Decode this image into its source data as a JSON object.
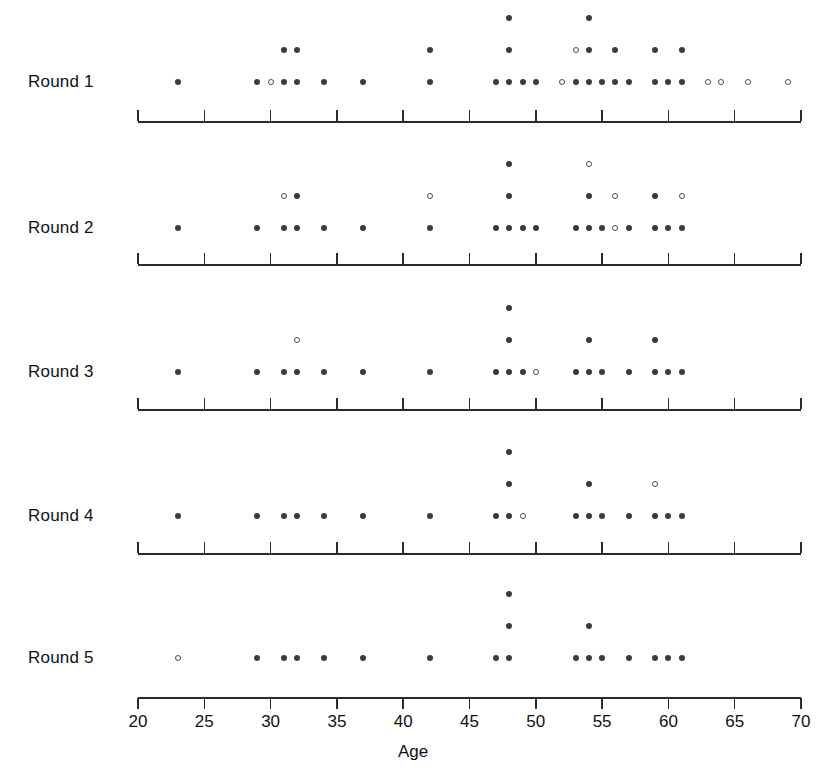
{
  "chart_data": {
    "type": "scatter",
    "title": "",
    "xlabel": "Age",
    "ylabel": "",
    "xlim": [
      20,
      70
    ],
    "xticks": [
      20,
      25,
      30,
      35,
      40,
      45,
      50,
      55,
      60,
      65,
      70
    ],
    "xtick_labels": [
      "20",
      "25",
      "30",
      "35",
      "40",
      "45",
      "50",
      "55",
      "60",
      "65",
      "70"
    ],
    "grid": false,
    "legend": "none",
    "marker_types": [
      "filled",
      "open"
    ],
    "colors": {
      "filled": "#3a3a42",
      "open": "#ffffff",
      "outline": "#4a4a52",
      "axis": "#2b2b2b"
    },
    "rows": [
      {
        "label": "Round 1",
        "points": [
          {
            "age": 23,
            "stack": 1,
            "marker": "filled"
          },
          {
            "age": 29,
            "stack": 1,
            "marker": "filled"
          },
          {
            "age": 30,
            "stack": 1,
            "marker": "open"
          },
          {
            "age": 31,
            "stack": 1,
            "marker": "filled"
          },
          {
            "age": 31,
            "stack": 2,
            "marker": "filled"
          },
          {
            "age": 32,
            "stack": 1,
            "marker": "filled"
          },
          {
            "age": 32,
            "stack": 2,
            "marker": "filled"
          },
          {
            "age": 34,
            "stack": 1,
            "marker": "filled"
          },
          {
            "age": 37,
            "stack": 1,
            "marker": "filled"
          },
          {
            "age": 42,
            "stack": 1,
            "marker": "filled"
          },
          {
            "age": 42,
            "stack": 2,
            "marker": "filled"
          },
          {
            "age": 47,
            "stack": 1,
            "marker": "filled"
          },
          {
            "age": 48,
            "stack": 1,
            "marker": "filled"
          },
          {
            "age": 48,
            "stack": 2,
            "marker": "filled"
          },
          {
            "age": 48,
            "stack": 3,
            "marker": "filled"
          },
          {
            "age": 49,
            "stack": 1,
            "marker": "filled"
          },
          {
            "age": 50,
            "stack": 1,
            "marker": "filled"
          },
          {
            "age": 52,
            "stack": 1,
            "marker": "open"
          },
          {
            "age": 53,
            "stack": 1,
            "marker": "filled"
          },
          {
            "age": 53,
            "stack": 2,
            "marker": "open"
          },
          {
            "age": 54,
            "stack": 1,
            "marker": "filled"
          },
          {
            "age": 54,
            "stack": 2,
            "marker": "filled"
          },
          {
            "age": 54,
            "stack": 3,
            "marker": "filled"
          },
          {
            "age": 55,
            "stack": 1,
            "marker": "filled"
          },
          {
            "age": 56,
            "stack": 1,
            "marker": "filled"
          },
          {
            "age": 56,
            "stack": 2,
            "marker": "filled"
          },
          {
            "age": 57,
            "stack": 1,
            "marker": "filled"
          },
          {
            "age": 59,
            "stack": 1,
            "marker": "filled"
          },
          {
            "age": 59,
            "stack": 2,
            "marker": "filled"
          },
          {
            "age": 60,
            "stack": 1,
            "marker": "filled"
          },
          {
            "age": 61,
            "stack": 1,
            "marker": "filled"
          },
          {
            "age": 61,
            "stack": 2,
            "marker": "filled"
          },
          {
            "age": 63,
            "stack": 1,
            "marker": "open"
          },
          {
            "age": 64,
            "stack": 1,
            "marker": "open"
          },
          {
            "age": 66,
            "stack": 1,
            "marker": "open"
          },
          {
            "age": 69,
            "stack": 1,
            "marker": "open"
          }
        ]
      },
      {
        "label": "Round 2",
        "points": [
          {
            "age": 23,
            "stack": 1,
            "marker": "filled"
          },
          {
            "age": 29,
            "stack": 1,
            "marker": "filled"
          },
          {
            "age": 31,
            "stack": 1,
            "marker": "filled"
          },
          {
            "age": 31,
            "stack": 2,
            "marker": "open"
          },
          {
            "age": 32,
            "stack": 1,
            "marker": "filled"
          },
          {
            "age": 32,
            "stack": 2,
            "marker": "filled"
          },
          {
            "age": 34,
            "stack": 1,
            "marker": "filled"
          },
          {
            "age": 37,
            "stack": 1,
            "marker": "filled"
          },
          {
            "age": 42,
            "stack": 1,
            "marker": "filled"
          },
          {
            "age": 42,
            "stack": 2,
            "marker": "open"
          },
          {
            "age": 47,
            "stack": 1,
            "marker": "filled"
          },
          {
            "age": 48,
            "stack": 1,
            "marker": "filled"
          },
          {
            "age": 48,
            "stack": 2,
            "marker": "filled"
          },
          {
            "age": 48,
            "stack": 3,
            "marker": "filled"
          },
          {
            "age": 49,
            "stack": 1,
            "marker": "filled"
          },
          {
            "age": 50,
            "stack": 1,
            "marker": "filled"
          },
          {
            "age": 53,
            "stack": 1,
            "marker": "filled"
          },
          {
            "age": 54,
            "stack": 1,
            "marker": "filled"
          },
          {
            "age": 54,
            "stack": 2,
            "marker": "filled"
          },
          {
            "age": 54,
            "stack": 3,
            "marker": "open"
          },
          {
            "age": 55,
            "stack": 1,
            "marker": "filled"
          },
          {
            "age": 56,
            "stack": 1,
            "marker": "open"
          },
          {
            "age": 56,
            "stack": 2,
            "marker": "open"
          },
          {
            "age": 57,
            "stack": 1,
            "marker": "filled"
          },
          {
            "age": 59,
            "stack": 1,
            "marker": "filled"
          },
          {
            "age": 59,
            "stack": 2,
            "marker": "filled"
          },
          {
            "age": 60,
            "stack": 1,
            "marker": "filled"
          },
          {
            "age": 61,
            "stack": 1,
            "marker": "filled"
          },
          {
            "age": 61,
            "stack": 2,
            "marker": "open"
          }
        ]
      },
      {
        "label": "Round 3",
        "points": [
          {
            "age": 23,
            "stack": 1,
            "marker": "filled"
          },
          {
            "age": 29,
            "stack": 1,
            "marker": "filled"
          },
          {
            "age": 31,
            "stack": 1,
            "marker": "filled"
          },
          {
            "age": 32,
            "stack": 1,
            "marker": "filled"
          },
          {
            "age": 32,
            "stack": 2,
            "marker": "open"
          },
          {
            "age": 34,
            "stack": 1,
            "marker": "filled"
          },
          {
            "age": 37,
            "stack": 1,
            "marker": "filled"
          },
          {
            "age": 42,
            "stack": 1,
            "marker": "filled"
          },
          {
            "age": 47,
            "stack": 1,
            "marker": "filled"
          },
          {
            "age": 48,
            "stack": 1,
            "marker": "filled"
          },
          {
            "age": 48,
            "stack": 2,
            "marker": "filled"
          },
          {
            "age": 48,
            "stack": 3,
            "marker": "filled"
          },
          {
            "age": 49,
            "stack": 1,
            "marker": "filled"
          },
          {
            "age": 50,
            "stack": 1,
            "marker": "open"
          },
          {
            "age": 53,
            "stack": 1,
            "marker": "filled"
          },
          {
            "age": 54,
            "stack": 1,
            "marker": "filled"
          },
          {
            "age": 54,
            "stack": 2,
            "marker": "filled"
          },
          {
            "age": 55,
            "stack": 1,
            "marker": "filled"
          },
          {
            "age": 57,
            "stack": 1,
            "marker": "filled"
          },
          {
            "age": 59,
            "stack": 1,
            "marker": "filled"
          },
          {
            "age": 59,
            "stack": 2,
            "marker": "filled"
          },
          {
            "age": 60,
            "stack": 1,
            "marker": "filled"
          },
          {
            "age": 61,
            "stack": 1,
            "marker": "filled"
          }
        ]
      },
      {
        "label": "Round 4",
        "points": [
          {
            "age": 23,
            "stack": 1,
            "marker": "filled"
          },
          {
            "age": 29,
            "stack": 1,
            "marker": "filled"
          },
          {
            "age": 31,
            "stack": 1,
            "marker": "filled"
          },
          {
            "age": 32,
            "stack": 1,
            "marker": "filled"
          },
          {
            "age": 34,
            "stack": 1,
            "marker": "filled"
          },
          {
            "age": 37,
            "stack": 1,
            "marker": "filled"
          },
          {
            "age": 42,
            "stack": 1,
            "marker": "filled"
          },
          {
            "age": 47,
            "stack": 1,
            "marker": "filled"
          },
          {
            "age": 48,
            "stack": 1,
            "marker": "filled"
          },
          {
            "age": 48,
            "stack": 2,
            "marker": "filled"
          },
          {
            "age": 48,
            "stack": 3,
            "marker": "filled"
          },
          {
            "age": 49,
            "stack": 1,
            "marker": "open"
          },
          {
            "age": 53,
            "stack": 1,
            "marker": "filled"
          },
          {
            "age": 54,
            "stack": 1,
            "marker": "filled"
          },
          {
            "age": 54,
            "stack": 2,
            "marker": "filled"
          },
          {
            "age": 55,
            "stack": 1,
            "marker": "filled"
          },
          {
            "age": 57,
            "stack": 1,
            "marker": "filled"
          },
          {
            "age": 59,
            "stack": 1,
            "marker": "filled"
          },
          {
            "age": 59,
            "stack": 2,
            "marker": "open"
          },
          {
            "age": 60,
            "stack": 1,
            "marker": "filled"
          },
          {
            "age": 61,
            "stack": 1,
            "marker": "filled"
          }
        ]
      },
      {
        "label": "Round 5",
        "points": [
          {
            "age": 23,
            "stack": 1,
            "marker": "open"
          },
          {
            "age": 29,
            "stack": 1,
            "marker": "filled"
          },
          {
            "age": 31,
            "stack": 1,
            "marker": "filled"
          },
          {
            "age": 32,
            "stack": 1,
            "marker": "filled"
          },
          {
            "age": 34,
            "stack": 1,
            "marker": "filled"
          },
          {
            "age": 37,
            "stack": 1,
            "marker": "filled"
          },
          {
            "age": 42,
            "stack": 1,
            "marker": "filled"
          },
          {
            "age": 47,
            "stack": 1,
            "marker": "filled"
          },
          {
            "age": 48,
            "stack": 1,
            "marker": "filled"
          },
          {
            "age": 48,
            "stack": 2,
            "marker": "filled"
          },
          {
            "age": 48,
            "stack": 3,
            "marker": "filled"
          },
          {
            "age": 53,
            "stack": 1,
            "marker": "filled"
          },
          {
            "age": 54,
            "stack": 1,
            "marker": "filled"
          },
          {
            "age": 54,
            "stack": 2,
            "marker": "filled"
          },
          {
            "age": 55,
            "stack": 1,
            "marker": "filled"
          },
          {
            "age": 57,
            "stack": 1,
            "marker": "filled"
          },
          {
            "age": 59,
            "stack": 1,
            "marker": "filled"
          },
          {
            "age": 60,
            "stack": 1,
            "marker": "filled"
          },
          {
            "age": 61,
            "stack": 1,
            "marker": "filled"
          }
        ]
      }
    ]
  }
}
